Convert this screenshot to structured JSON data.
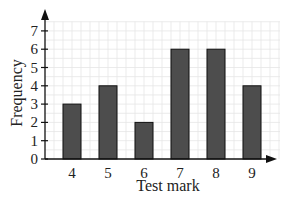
{
  "chart_data": {
    "type": "bar",
    "title": "",
    "xlabel": "Test mark",
    "ylabel": "Frequency",
    "categories": [
      "4",
      "5",
      "6",
      "7",
      "8",
      "9"
    ],
    "values": [
      3,
      4,
      2,
      6,
      6,
      4
    ],
    "yticks": [
      "0",
      "1",
      "2",
      "3",
      "4",
      "5",
      "6",
      "7"
    ],
    "ylim": [
      0,
      7.5
    ],
    "grid": true,
    "legend": null,
    "bar_color": "#4d4d4d",
    "grid_color": "#e6e6e6",
    "axis_color": "#111111"
  }
}
